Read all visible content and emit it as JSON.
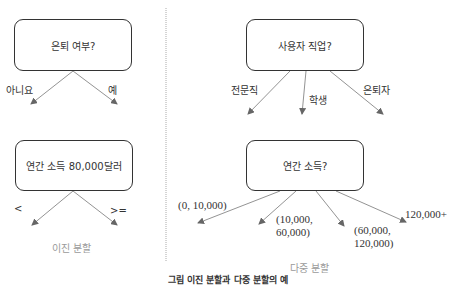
{
  "binary_split": {
    "node1": {
      "question": "은퇴 여부?",
      "branches": [
        "아니요",
        "예"
      ]
    },
    "node2": {
      "question": "연간 소득 80,000달러",
      "branches": [
        "<",
        ">="
      ]
    },
    "subtitle": "이진 분할"
  },
  "multi_split": {
    "node1": {
      "question": "사용자 직업?",
      "branches": [
        "전문직",
        "학생",
        "은퇴자"
      ]
    },
    "node2": {
      "question": "연간 소득?",
      "branches": [
        {
          "line1": "(0, 10,000)",
          "line2": ""
        },
        {
          "line1": "(10,000,",
          "line2": "60,000)"
        },
        {
          "line1": "(60,000,",
          "line2": "120,000)"
        },
        {
          "line1": "120,000+",
          "line2": ""
        }
      ]
    },
    "subtitle": "다중 분할"
  },
  "caption": "그림 이진 분할과 다중 분할의 예",
  "colors": {
    "line": "#777777",
    "box_border": "#333333",
    "subtitle": "#9a9a9a"
  }
}
